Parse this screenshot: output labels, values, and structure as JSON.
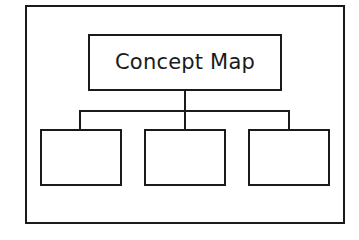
{
  "diagram": {
    "title": "Concept Map",
    "children": [
      {
        "label": ""
      },
      {
        "label": ""
      },
      {
        "label": ""
      }
    ],
    "colors": {
      "stroke": "#1a1a1a",
      "background": "#ffffff"
    }
  }
}
